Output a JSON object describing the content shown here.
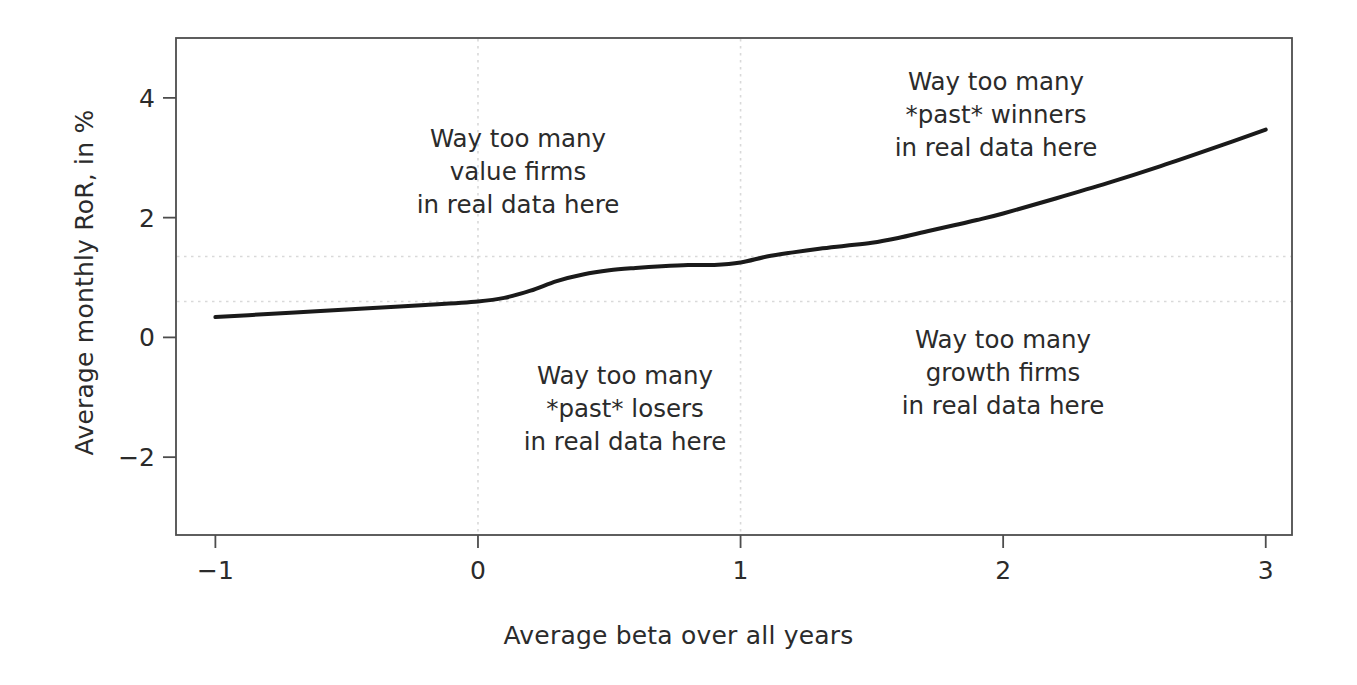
{
  "chart_data": {
    "type": "line",
    "title": "",
    "xlabel": "Average beta over all years",
    "ylabel": "Average monthly RoR, in %",
    "xlim": [
      -1.15,
      3.1
    ],
    "ylim": [
      -3.3,
      5.0
    ],
    "xticks": [
      -1,
      0,
      1,
      2,
      3
    ],
    "xticklabels": [
      "−1",
      "0",
      "1",
      "2",
      "3"
    ],
    "yticks": [
      -2,
      0,
      2,
      4
    ],
    "yticklabels": [
      "−2",
      "0",
      "2",
      "4"
    ],
    "grid": false,
    "legend": "none",
    "line_color": "#1a1a1a",
    "line_width": 4.0,
    "series": [
      {
        "name": "Average monthly RoR vs average beta",
        "x": [
          -1.0,
          -0.8,
          -0.6,
          -0.4,
          -0.2,
          0.0,
          0.1,
          0.2,
          0.3,
          0.4,
          0.5,
          0.6,
          0.7,
          0.8,
          0.9,
          1.0,
          1.1,
          1.2,
          1.3,
          1.4,
          1.5,
          1.6,
          1.7,
          1.8,
          1.9,
          2.0,
          2.2,
          2.4,
          2.6,
          2.8,
          3.0
        ],
        "y": [
          0.34,
          0.39,
          0.44,
          0.49,
          0.54,
          0.6,
          0.66,
          0.78,
          0.94,
          1.05,
          1.12,
          1.16,
          1.19,
          1.21,
          1.21,
          1.25,
          1.35,
          1.42,
          1.48,
          1.53,
          1.58,
          1.66,
          1.76,
          1.86,
          1.96,
          2.07,
          2.32,
          2.58,
          2.86,
          3.16,
          3.47
        ]
      }
    ],
    "reference_lines": [
      {
        "orientation": "horizontal",
        "value": 1.35,
        "style": "dotted"
      },
      {
        "orientation": "horizontal",
        "value": 0.6,
        "style": "dotted"
      },
      {
        "orientation": "vertical",
        "value": 0.0,
        "style": "dotted"
      },
      {
        "orientation": "vertical",
        "value": 1.0,
        "style": "dotted"
      }
    ],
    "annotations": [
      {
        "id": "value-firms",
        "lines": [
          "Way too many",
          "value firms",
          "in real data here"
        ],
        "x": 0.16,
        "y": 3.55
      },
      {
        "id": "past-winners",
        "lines": [
          "Way too many",
          "*past* winners",
          "in real data here"
        ],
        "x": 1.82,
        "y": 4.45
      },
      {
        "id": "past-losers",
        "lines": [
          "Way too many",
          "*past* losers",
          "in real data here"
        ],
        "x": 0.35,
        "y": -0.92
      },
      {
        "id": "growth-firms",
        "lines": [
          "Way too many",
          "growth firms",
          "in real data here"
        ],
        "x": 1.85,
        "y": -0.3
      }
    ]
  },
  "axes": {
    "xlabel": "Average beta over all years",
    "ylabel": "Average monthly RoR, in %"
  },
  "annotations": {
    "value_firms": {
      "line1": "Way too many",
      "line2": "value firms",
      "line3": "in real data here"
    },
    "past_winners": {
      "line1": "Way too many",
      "line2": "*past* winners",
      "line3": "in real data here"
    },
    "past_losers": {
      "line1": "Way too many",
      "line2": "*past* losers",
      "line3": "in real data here"
    },
    "growth_firms": {
      "line1": "Way too many",
      "line2": "growth firms",
      "line3": "in real data here"
    }
  },
  "colors": {
    "line": "#1a1a1a",
    "frame": "#4d4d4d",
    "text": "#2b2b2b",
    "reference": "#d9d9d9",
    "background": "#ffffff"
  }
}
